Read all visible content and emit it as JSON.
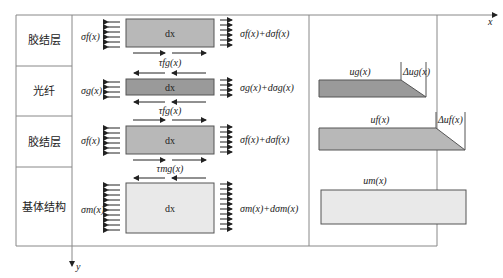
{
  "layers": [
    {
      "label": "胶结层",
      "sigma_left": "σf(x)",
      "sigma_right": "σf(x)+dσf(x)",
      "element": "dx",
      "fill": "#b8b8b8",
      "disp_label": "",
      "delta_label": ""
    },
    {
      "label": "光纤",
      "sigma_left": "σg(x)",
      "sigma_right": "σg(x)+dσg(x)",
      "element": "dx",
      "fill": "#9a9a9a",
      "disp_label": "ug(x)",
      "delta_label": "Δug(x)"
    },
    {
      "label": "胶结层",
      "sigma_left": "σf(x)",
      "sigma_right": "σf(x)+dσf(x)",
      "element": "dx",
      "fill": "#b8b8b8",
      "disp_label": "uf(x)",
      "delta_label": "Δuf(x)"
    },
    {
      "label": "基体结构",
      "sigma_left": "σm(x)",
      "sigma_right": "σm(x)+dσm(x)",
      "element": "dx",
      "fill": "#ececec",
      "disp_label": "um(x)",
      "delta_label": ""
    }
  ],
  "shear": {
    "tau_fg": "τfg(x)",
    "tau_fg2": "τfg(x)",
    "tau_mg": "τmg(x)"
  },
  "axes": {
    "x": "x",
    "y": "y"
  },
  "colors": {
    "frame": "#777777",
    "ink": "#222222",
    "fiber": "#9a9a9a",
    "adhesive": "#b8b8b8",
    "matrix": "#ececec"
  }
}
